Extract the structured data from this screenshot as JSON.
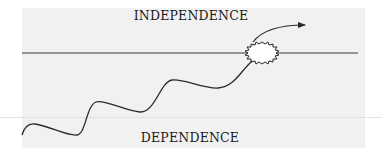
{
  "diagram": {
    "labels": {
      "top": "INDEPENDENCE",
      "bottom": "DEPENDENCE"
    },
    "elements": {
      "threshold_line": "horizontal-threshold-line",
      "growth_curve": "wavy-growth-curve",
      "breakthrough": "starburst-breakthrough",
      "continuation": "arrow-continuation"
    },
    "colors": {
      "background": "#f1f1f1",
      "stroke": "#2a2a2a",
      "text": "#1a1a1a"
    }
  }
}
